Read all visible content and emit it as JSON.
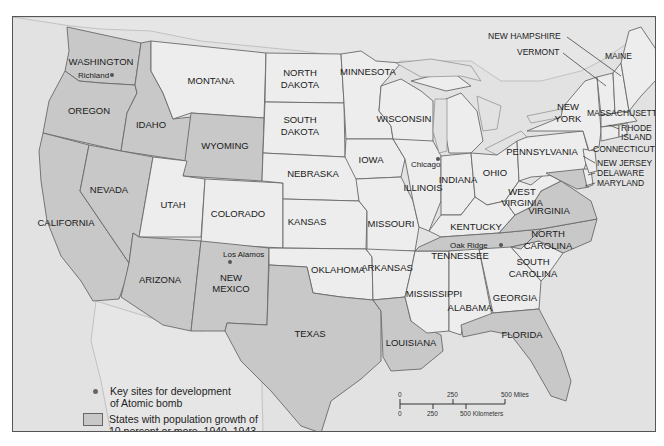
{
  "map": {
    "title": "",
    "colors": {
      "shaded_state": "#c8c8c8",
      "unshaded_state": "#ededed",
      "water": "#e2e2e2",
      "border": "#6a6a6a"
    },
    "states": [
      {
        "name": "WASHINGTON",
        "shaded": true
      },
      {
        "name": "OREGON",
        "shaded": true
      },
      {
        "name": "CALIFORNIA",
        "shaded": true
      },
      {
        "name": "IDAHO",
        "shaded": true
      },
      {
        "name": "NEVADA",
        "shaded": true
      },
      {
        "name": "MONTANA",
        "shaded": false
      },
      {
        "name": "WYOMING",
        "shaded": true
      },
      {
        "name": "UTAH",
        "shaded": false
      },
      {
        "name": "COLORADO",
        "shaded": false
      },
      {
        "name": "ARIZONA",
        "shaded": true
      },
      {
        "name": "NEW MEXICO",
        "shaded": true
      },
      {
        "name": "NORTH DAKOTA",
        "shaded": false
      },
      {
        "name": "SOUTH DAKOTA",
        "shaded": false
      },
      {
        "name": "NEBRASKA",
        "shaded": false
      },
      {
        "name": "KANSAS",
        "shaded": false
      },
      {
        "name": "OKLAHOMA",
        "shaded": false
      },
      {
        "name": "TEXAS",
        "shaded": true
      },
      {
        "name": "MINNESOTA",
        "shaded": false
      },
      {
        "name": "IOWA",
        "shaded": false
      },
      {
        "name": "MISSOURI",
        "shaded": false
      },
      {
        "name": "ARKANSAS",
        "shaded": false
      },
      {
        "name": "LOUISIANA",
        "shaded": true
      },
      {
        "name": "WISCONSIN",
        "shaded": false
      },
      {
        "name": "ILLINOIS",
        "shaded": false
      },
      {
        "name": "MISSISSIPPI",
        "shaded": false
      },
      {
        "name": "INDIANA",
        "shaded": false
      },
      {
        "name": "OHIO",
        "shaded": false
      },
      {
        "name": "KENTUCKY",
        "shaded": false
      },
      {
        "name": "TENNESSEE",
        "shaded": true
      },
      {
        "name": "ALABAMA",
        "shaded": false
      },
      {
        "name": "GEORGIA",
        "shaded": false
      },
      {
        "name": "FLORIDA",
        "shaded": true
      },
      {
        "name": "SOUTH CAROLINA",
        "shaded": false
      },
      {
        "name": "NORTH CAROLINA",
        "shaded": true
      },
      {
        "name": "VIRGINIA",
        "shaded": true
      },
      {
        "name": "WEST VIRGINIA",
        "shaded": false
      },
      {
        "name": "PENNSYLVANIA",
        "shaded": false
      },
      {
        "name": "NEW YORK",
        "shaded": false
      },
      {
        "name": "VERMONT",
        "shaded": false
      },
      {
        "name": "NEW HAMPSHIRE",
        "shaded": false
      },
      {
        "name": "MAINE",
        "shaded": false
      },
      {
        "name": "MASSACHUSETTS",
        "shaded": false
      },
      {
        "name": "RHODE ISLAND",
        "shaded": false
      },
      {
        "name": "CONNECTICUT",
        "shaded": false
      },
      {
        "name": "NEW JERSEY",
        "shaded": false
      },
      {
        "name": "DELAWARE",
        "shaded": false
      },
      {
        "name": "MARYLAND",
        "shaded": true
      }
    ],
    "labels": {
      "washington": "WASHINGTON",
      "oregon": "OREGON",
      "california": "CALIFORNIA",
      "idaho": "IDAHO",
      "nevada": "NEVADA",
      "montana": "MONTANA",
      "wyoming": "WYOMING",
      "utah": "UTAH",
      "colorado": "COLORADO",
      "arizona": "ARIZONA",
      "new_mexico_1": "NEW",
      "new_mexico_2": "MEXICO",
      "north_dakota_1": "NORTH",
      "north_dakota_2": "DAKOTA",
      "south_dakota_1": "SOUTH",
      "south_dakota_2": "DAKOTA",
      "nebraska": "NEBRASKA",
      "kansas": "KANSAS",
      "oklahoma": "OKLAHOMA",
      "texas": "TEXAS",
      "minnesota": "MINNESOTA",
      "iowa": "IOWA",
      "missouri": "MISSOURI",
      "arkansas": "ARKANSAS",
      "louisiana": "LOUISIANA",
      "wisconsin": "WISCONSIN",
      "illinois": "ILLINOIS",
      "mississippi": "MISSISSIPPI",
      "indiana": "INDIANA",
      "ohio": "OHIO",
      "kentucky": "KENTUCKY",
      "tennessee": "TENNESSEE",
      "alabama": "ALABAMA",
      "georgia": "GEORGIA",
      "florida": "FLORIDA",
      "south_carolina_1": "SOUTH",
      "south_carolina_2": "CAROLINA",
      "north_carolina_1": "NORTH",
      "north_carolina_2": "CAROLINA",
      "virginia": "VIRGINIA",
      "west_virginia_1": "WEST",
      "west_virginia_2": "VIRGINIA",
      "pennsylvania": "PENNSYLVANIA",
      "new_york_1": "NEW",
      "new_york_2": "YORK",
      "vermont": "VERMONT",
      "new_hampshire": "NEW HAMPSHIRE",
      "maine": "MAINE",
      "massachusetts": "MASSACHUSETTS",
      "rhode_island_1": "RHODE",
      "rhode_island_2": "ISLAND",
      "connecticut": "CONNECTICUT",
      "new_jersey": "NEW JERSEY",
      "delaware": "DELAWARE",
      "maryland": "MARYLAND"
    },
    "sites": [
      {
        "id": "richland",
        "name": "Richland"
      },
      {
        "id": "los_alamos",
        "name": "Los Alamos"
      },
      {
        "id": "chicago",
        "name": "Chicago"
      },
      {
        "id": "oak_ridge",
        "name": "Oak Ridge"
      }
    ],
    "site_labels": {
      "richland": "Richland",
      "los_alamos": "Los Alamos",
      "chicago": "Chicago",
      "oak_ridge": "Oak Ridge"
    }
  },
  "legend": {
    "items": [
      {
        "symbol": "dot",
        "text": "Key sites for development\nof Atomic bomb"
      },
      {
        "symbol": "swatch",
        "text": "States with population growth of\n10 percent or more, 1940–1943"
      }
    ]
  },
  "scale": {
    "miles": {
      "ticks": [
        "0",
        "250",
        "500 Miles"
      ]
    },
    "kilometers": {
      "ticks": [
        "0",
        "250",
        "500 Kilometers"
      ]
    }
  }
}
